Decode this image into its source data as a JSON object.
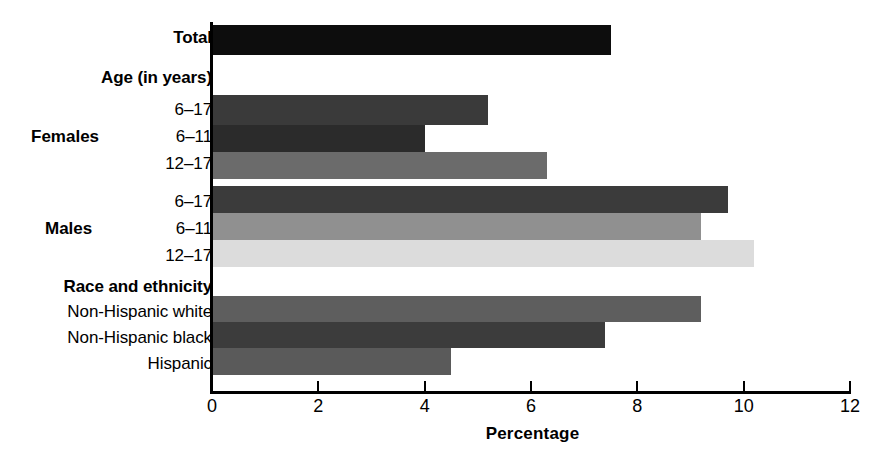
{
  "chart_data": {
    "type": "bar",
    "orientation": "horizontal",
    "title": "",
    "xlabel": "Percentage",
    "ylabel": "",
    "xlim": [
      0,
      12
    ],
    "xticks": [
      0,
      2,
      4,
      6,
      8,
      10,
      12
    ],
    "xtick_labels": [
      "0",
      "2",
      "4",
      "6",
      "8",
      "10",
      "12"
    ],
    "grid": false,
    "legend": false,
    "group_labels": [
      "Females",
      "Males"
    ],
    "section_headers": [
      "Age (in years)",
      "Race and ethnicity"
    ],
    "categories": [
      "Total",
      "6–17",
      "6–11",
      "12–17",
      "6–17",
      "6–11",
      "12–17",
      "Non-Hispanic white",
      "Non-Hispanic black",
      "Hispanic"
    ],
    "values": [
      7.5,
      5.2,
      4.0,
      6.3,
      9.7,
      9.2,
      10.2,
      9.2,
      7.4,
      4.5
    ],
    "bars": [
      {
        "label": "Total",
        "group": "",
        "value": 7.5,
        "color": "#0d0d0d",
        "bold": true
      },
      {
        "label": "6–17",
        "group": "Females",
        "value": 5.2,
        "color": "#3a3a3a",
        "bold": false
      },
      {
        "label": "6–11",
        "group": "Females",
        "value": 4.0,
        "color": "#2b2b2b",
        "bold": false
      },
      {
        "label": "12–17",
        "group": "Females",
        "value": 6.3,
        "color": "#6b6b6b",
        "bold": false
      },
      {
        "label": "6–17",
        "group": "Males",
        "value": 9.7,
        "color": "#3b3b3b",
        "bold": false
      },
      {
        "label": "6–11",
        "group": "Males",
        "value": 9.2,
        "color": "#909090",
        "bold": false
      },
      {
        "label": "12–17",
        "group": "Males",
        "value": 10.2,
        "color": "#dcdcdc",
        "bold": false
      },
      {
        "label": "Non-Hispanic white",
        "group": "",
        "value": 9.2,
        "color": "#5e5e5e",
        "bold": false
      },
      {
        "label": "Non-Hispanic black",
        "group": "",
        "value": 7.4,
        "color": "#3c3c3c",
        "bold": false
      },
      {
        "label": "Hispanic",
        "group": "",
        "value": 4.5,
        "color": "#5a5a5a",
        "bold": false
      }
    ]
  },
  "labels": {
    "total": "Total",
    "age_header": "Age (in years)",
    "females": "Females",
    "males": "Males",
    "race_header": "Race and ethnicity",
    "f_6_17": "6–17",
    "f_6_11": "6–11",
    "f_12_17": "12–17",
    "m_6_17": "6–17",
    "m_6_11": "6–11",
    "m_12_17": "12–17",
    "nh_white": "Non-Hispanic white",
    "nh_black": "Non-Hispanic black",
    "hispanic": "Hispanic"
  },
  "axis": {
    "title": "Percentage",
    "ticks": [
      "0",
      "2",
      "4",
      "6",
      "8",
      "10",
      "12"
    ]
  }
}
